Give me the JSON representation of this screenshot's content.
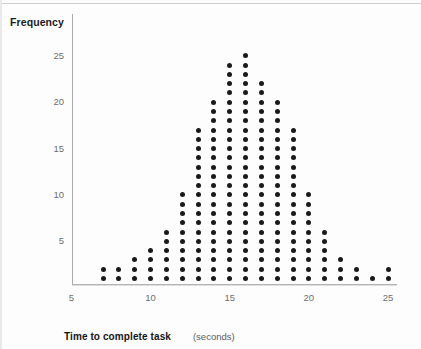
{
  "labels": {
    "y_axis_title": "Frequency",
    "x_axis_title": "Time to complete task",
    "x_axis_unit": "(seconds)"
  },
  "axes": {
    "y_ticks": [
      "5",
      "10",
      "15",
      "20",
      "25"
    ],
    "x_ticks": [
      "5",
      "10",
      "15",
      "20",
      "25"
    ]
  },
  "colors": {
    "dot": "#1a1a1a",
    "axis": "#a9a9a9",
    "tick_text": "#6e6e6e",
    "title_text": "#141414",
    "background": "#fdfdfd"
  },
  "chart_data": {
    "type": "bar",
    "title": "",
    "subtitle": "",
    "xlabel": "Time to complete task (seconds)",
    "ylabel": "Frequency",
    "xlim": [
      5,
      25
    ],
    "ylim": [
      0,
      26
    ],
    "grid": false,
    "legend": "none",
    "plot_style": "dot-plot",
    "dot_unit_value": 1,
    "categories": [
      7,
      8,
      9,
      10,
      11,
      12,
      13,
      14,
      15,
      16,
      17,
      18,
      19,
      20,
      21,
      22,
      23,
      24,
      25
    ],
    "values": [
      2,
      2,
      3,
      4,
      6,
      10,
      17,
      20,
      24,
      25,
      22,
      20,
      17,
      10,
      6,
      3,
      2,
      1,
      2
    ],
    "points": [
      {
        "x": 7,
        "frequency": 2
      },
      {
        "x": 8,
        "frequency": 2
      },
      {
        "x": 9,
        "frequency": 3
      },
      {
        "x": 10,
        "frequency": 4
      },
      {
        "x": 11,
        "frequency": 6
      },
      {
        "x": 12,
        "frequency": 10
      },
      {
        "x": 13,
        "frequency": 17
      },
      {
        "x": 14,
        "frequency": 20
      },
      {
        "x": 15,
        "frequency": 24
      },
      {
        "x": 16,
        "frequency": 25
      },
      {
        "x": 17,
        "frequency": 22
      },
      {
        "x": 18,
        "frequency": 20
      },
      {
        "x": 19,
        "frequency": 17
      },
      {
        "x": 20,
        "frequency": 10
      },
      {
        "x": 21,
        "frequency": 6
      },
      {
        "x": 22,
        "frequency": 3
      },
      {
        "x": 23,
        "frequency": 2
      },
      {
        "x": 24,
        "frequency": 1
      },
      {
        "x": 25,
        "frequency": 2
      }
    ]
  }
}
